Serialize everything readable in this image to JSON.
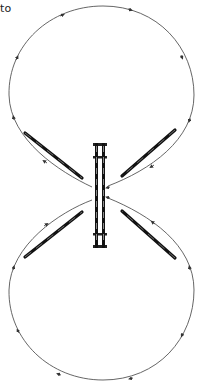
{
  "caption_fragment": "to",
  "diagram": {
    "colors": {
      "line": "#555555",
      "rod_dark": "#111111",
      "rod_light": "#999999",
      "arrow": "#333333"
    },
    "loops": [
      {
        "name": "upper-loop",
        "direction": "clockwise-into-center"
      },
      {
        "name": "lower-loop",
        "direction": "counterclockwise-into-center"
      }
    ],
    "rods": [
      "upper-left-rod",
      "upper-right-rod",
      "lower-left-rod",
      "lower-right-rod"
    ],
    "center_element": "vertical-bar"
  }
}
